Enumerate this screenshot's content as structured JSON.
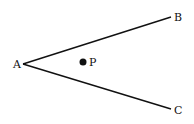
{
  "diagram": {
    "type": "angle-with-interior-point",
    "stroke_color": "#111111",
    "background": "#ffffff",
    "vertex": {
      "label": "A",
      "x": 23,
      "y": 64
    },
    "ray_ends": [
      {
        "label": "B",
        "x": 171,
        "y": 17
      },
      {
        "label": "C",
        "x": 171,
        "y": 109
      }
    ],
    "point": {
      "label": "P",
      "x": 83,
      "y": 62,
      "radius": 3.5
    },
    "labels": {
      "A": {
        "text": "A",
        "x": 13,
        "y": 68
      },
      "B": {
        "text": "B",
        "x": 174,
        "y": 21
      },
      "C": {
        "text": "C",
        "x": 174,
        "y": 114
      },
      "P": {
        "text": "P",
        "x": 89,
        "y": 66
      }
    }
  }
}
